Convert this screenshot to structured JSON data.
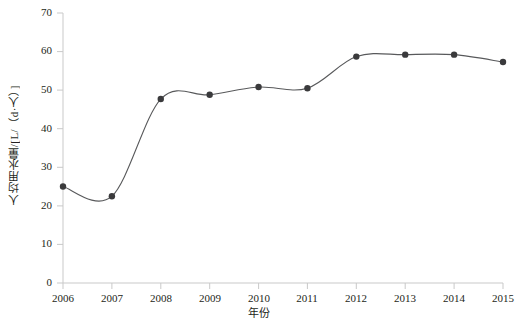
{
  "chart_data": {
    "type": "line",
    "title": "",
    "xlabel": "年份",
    "ylabel": "人均用水量/[L/（d·人）]",
    "categories": [
      "2006",
      "2007",
      "2008",
      "2009",
      "2010",
      "2011",
      "2012",
      "2013",
      "2014",
      "2015"
    ],
    "x": [
      2006,
      2007,
      2008,
      2009,
      2010,
      2011,
      2012,
      2013,
      2014,
      2015
    ],
    "values": [
      25.0,
      22.5,
      47.7,
      48.8,
      50.8,
      50.5,
      58.7,
      59.2,
      59.2,
      57.3
    ],
    "series": [
      {
        "name": "人均用水量",
        "values": [
          25.0,
          22.5,
          47.7,
          48.8,
          50.8,
          50.5,
          58.7,
          59.2,
          59.2,
          57.3
        ]
      }
    ],
    "ylim": [
      0,
      70
    ],
    "yticks": [
      0,
      10,
      20,
      30,
      40,
      50,
      60,
      70
    ],
    "ytick_labels": [
      "0",
      "10",
      "20",
      "30",
      "40",
      "50",
      "60",
      "70"
    ],
    "xtick_labels": [
      "2006",
      "2007",
      "2008",
      "2009",
      "2010",
      "2011",
      "2012",
      "2013",
      "2014",
      "2015"
    ],
    "grid": false,
    "legend": "none",
    "smoothing": "spline",
    "marker": "filled-circle",
    "line_color": "#58595b",
    "marker_color": "#3a3a3c",
    "axis_color": "#c9c9c9",
    "text_color": "#231f20",
    "background": "#ffffff"
  },
  "axes": {
    "y_axis_name": "y-axis",
    "x_axis_name": "x-axis"
  },
  "caption": {
    "partial_text": ""
  }
}
